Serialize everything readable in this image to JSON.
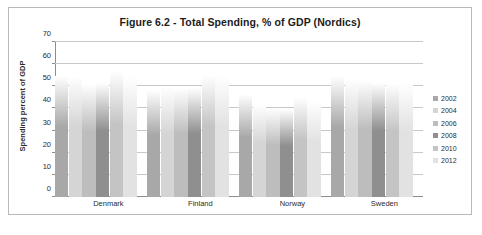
{
  "chart_data": {
    "type": "bar",
    "title": "Figure 6.2 - Total Spending, % of GDP (Nordics)",
    "xlabel": "",
    "ylabel": "Spending percent of GDP",
    "ylim": [
      0,
      70
    ],
    "ytick_step": 10,
    "yticks": [
      0,
      10,
      20,
      30,
      40,
      50,
      60,
      70
    ],
    "ytick_labels": [
      "0",
      "10",
      "20",
      "30",
      "40",
      "50",
      "60",
      "70"
    ],
    "grid": true,
    "legend_position": "right",
    "categories": [
      "Denmark",
      "Finland",
      "Norway",
      "Sweden"
    ],
    "series": [
      {
        "name": "2002",
        "color": "#a8a8a8",
        "values": [
          54.6,
          48.4,
          46.7,
          54.8
        ]
      },
      {
        "name": "2004",
        "color": "#d5d5d5",
        "values": [
          54.6,
          49.9,
          42.2,
          53.4
        ]
      },
      {
        "name": "2006",
        "color": "#bdbdbd",
        "values": [
          51.2,
          49.1,
          40.0,
          52.7
        ]
      },
      {
        "name": "2008",
        "color": "#8f8f8f",
        "values": [
          51.3,
          49.3,
          39.8,
          51.7
        ]
      },
      {
        "name": "2010",
        "color": "#c4c4c4",
        "values": [
          57.0,
          55.3,
          45.2,
          51.3
        ]
      },
      {
        "name": "2012",
        "color": "#e2e2e2",
        "values": [
          54.7,
          55.2,
          43.4,
          51.4
        ]
      }
    ]
  },
  "legend": {
    "items": [
      {
        "label": "2002"
      },
      {
        "label": "2004"
      },
      {
        "label": "2006"
      },
      {
        "label": "2008"
      },
      {
        "label": "2010"
      },
      {
        "label": "2012"
      }
    ]
  }
}
